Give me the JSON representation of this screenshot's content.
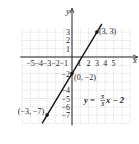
{
  "chart_data": {
    "type": "line",
    "title": "",
    "xlabel": "x",
    "ylabel": "y",
    "xlim": [
      -6,
      7
    ],
    "ylim": [
      -8,
      4
    ],
    "grid": true,
    "x_ticks": [
      "-5",
      "-4",
      "-3",
      "-2",
      "-1",
      "2",
      "3",
      "4",
      "5"
    ],
    "y_ticks": [
      "3",
      "2",
      "1",
      "-2",
      "-4",
      "-5",
      "-6",
      "-7"
    ],
    "series": [
      {
        "name": "y = 5/3 x - 2",
        "slope": 1.6667,
        "intercept": -2,
        "x": [
          -3.6,
          3.6
        ],
        "y": [
          -8,
          4
        ]
      }
    ],
    "points": [
      {
        "label": "(3, 3)",
        "x": 3,
        "y": 3
      },
      {
        "label": "(0, −2)",
        "x": 0,
        "y": -2
      },
      {
        "label": "(−3, −7)",
        "x": -3,
        "y": -7
      }
    ],
    "equation": {
      "lhs": "y = ",
      "num": "5",
      "den": "3",
      "rhs": "x − 2"
    }
  }
}
